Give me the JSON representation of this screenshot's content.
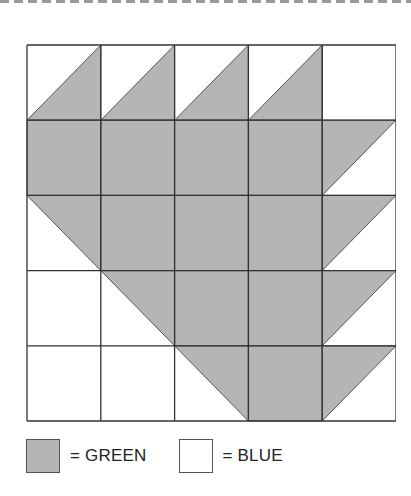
{
  "diagram": {
    "rows": 5,
    "cols": 5,
    "cell_size": 73.8,
    "fill_color": "#b5b5b5",
    "empty_color": "#ffffff",
    "line_color": "#333333",
    "cells": [
      [
        "br",
        "br",
        "br",
        "br",
        "empty"
      ],
      [
        "full",
        "full",
        "full",
        "full",
        "tl"
      ],
      [
        "tr",
        "full",
        "full",
        "full",
        "tl"
      ],
      [
        "empty",
        "tr",
        "full",
        "full",
        "tl"
      ],
      [
        "empty",
        "empty",
        "tr",
        "full",
        "tl"
      ]
    ]
  },
  "legend": {
    "items": [
      {
        "label": "= GREEN",
        "color": "#b5b5b5"
      },
      {
        "label": "= BLUE",
        "color": "#ffffff"
      }
    ]
  }
}
